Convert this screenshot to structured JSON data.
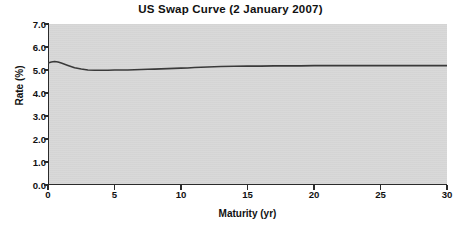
{
  "chart_data": {
    "type": "line",
    "title": "US Swap Curve (2 January 2007)",
    "xlabel": "Maturity (yr)",
    "ylabel": "Rate (%)",
    "xlim": [
      0,
      30
    ],
    "ylim": [
      0.0,
      7.0
    ],
    "xticks": [
      "0",
      "5",
      "10",
      "15",
      "20",
      "25",
      "30"
    ],
    "xtick_values": [
      0,
      5,
      10,
      15,
      20,
      25,
      30
    ],
    "yticks": [
      "0.0",
      "1.0",
      "2.0",
      "3.0",
      "4.0",
      "5.0",
      "6.0",
      "7.0"
    ],
    "ytick_values": [
      0.0,
      1.0,
      2.0,
      3.0,
      4.0,
      5.0,
      6.0,
      7.0
    ],
    "grid": false,
    "legend": "none",
    "plot_background_color": "#d7d7d7",
    "line_color": "#3a3a3a",
    "series": [
      {
        "name": "US Swap Curve",
        "x": [
          0,
          0.25,
          0.5,
          0.75,
          1,
          1.5,
          2,
          2.5,
          3,
          3.5,
          4,
          4.5,
          5,
          5.5,
          6,
          6.5,
          7,
          7.5,
          8,
          8.5,
          9,
          9.5,
          10,
          10.5,
          11,
          12,
          13,
          14,
          15,
          16,
          17,
          18,
          19,
          20,
          22,
          24,
          26,
          28,
          30
        ],
        "values": [
          5.3,
          5.35,
          5.37,
          5.35,
          5.3,
          5.2,
          5.1,
          5.04,
          5.0,
          4.99,
          4.99,
          4.99,
          5.0,
          5.0,
          5.0,
          5.01,
          5.02,
          5.03,
          5.04,
          5.05,
          5.06,
          5.07,
          5.08,
          5.09,
          5.11,
          5.13,
          5.15,
          5.16,
          5.17,
          5.17,
          5.18,
          5.18,
          5.18,
          5.19,
          5.19,
          5.19,
          5.19,
          5.19,
          5.19
        ]
      }
    ]
  }
}
